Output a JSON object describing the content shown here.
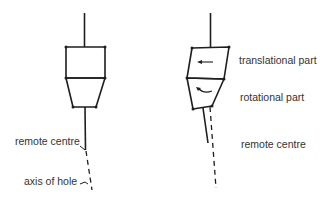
{
  "colors": {
    "background": "#ffffff",
    "line": "#1e1e1e",
    "text": "#333333"
  },
  "left_figure": {
    "labels": {
      "remote_centre": "remote centre",
      "axis_of_hole": "axis of hole"
    }
  },
  "right_figure": {
    "labels": {
      "translational_part": "translational part",
      "rotational_part": "rotational part",
      "remote_centre": "remote centre"
    },
    "icons": {
      "translation_arrow": "arrow-left-icon",
      "rotation_arrow": "curved-arrow-icon"
    }
  }
}
